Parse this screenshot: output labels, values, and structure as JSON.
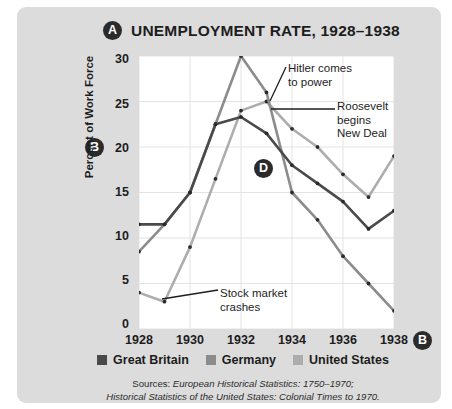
{
  "figure": {
    "marker_a": "A",
    "marker_b": "B",
    "marker_d": "D",
    "title": "UNEMPLOYMENT RATE, 1928–1938"
  },
  "axes": {
    "ylabel": "Percent of Work Force",
    "y_ticks": [
      "0",
      "5",
      "10",
      "15",
      "20",
      "25",
      "30"
    ],
    "x_ticks": [
      "1928",
      "1930",
      "1932",
      "1934",
      "1936",
      "1938"
    ]
  },
  "legend": {
    "items": [
      {
        "label": "Great Britain",
        "color": "#4a4a4a"
      },
      {
        "label": "Germany",
        "color": "#8c8c8c"
      },
      {
        "label": "United States",
        "color": "#adadad"
      }
    ]
  },
  "annotations": [
    {
      "id": "hitler",
      "text": "Hitler comes\nto power"
    },
    {
      "id": "roosevelt",
      "text": "Roosevelt\nbegins\nNew Deal"
    },
    {
      "id": "crash",
      "text": "Stock market\ncrashes"
    }
  ],
  "sources": {
    "line1_prefix": "Sources: ",
    "line1_italic": "European Historical Statistics: 1750–1970;",
    "line2_italic": "Historical Statistics of the United States: Colonial Times to 1970."
  },
  "chart_data": {
    "type": "line",
    "title": "UNEMPLOYMENT RATE, 1928–1938",
    "xlabel": "",
    "ylabel": "Percent of Work Force",
    "xlim": [
      1928,
      1938
    ],
    "ylim": [
      0,
      30
    ],
    "y_ticks": [
      0,
      5,
      10,
      15,
      20,
      25,
      30
    ],
    "x_ticks": [
      1928,
      1930,
      1932,
      1934,
      1936,
      1938
    ],
    "grid": true,
    "legend_position": "bottom",
    "x": [
      1928,
      1929,
      1930,
      1931,
      1932,
      1933,
      1934,
      1935,
      1936,
      1937,
      1938
    ],
    "series": [
      {
        "name": "Great Britain",
        "color": "#4a4a4a",
        "values": [
          11.5,
          11.5,
          15.0,
          22.5,
          23.3,
          21.5,
          18.0,
          16.0,
          14.0,
          11.0,
          13.0
        ]
      },
      {
        "name": "Germany",
        "color": "#8c8c8c",
        "values": [
          8.5,
          11.5,
          15.0,
          22.5,
          30.0,
          26.0,
          15.0,
          12.0,
          8.0,
          5.0,
          2.0
        ]
      },
      {
        "name": "United States",
        "color": "#adadad",
        "values": [
          4.0,
          3.0,
          9.0,
          16.5,
          24.0,
          25.0,
          22.0,
          20.0,
          17.0,
          14.5,
          19.0
        ]
      }
    ],
    "annotations": [
      {
        "text": "Hitler comes to power",
        "points_to_year": 1933,
        "points_to_value": 26.0
      },
      {
        "text": "Roosevelt begins New Deal",
        "points_to_year": 1933,
        "points_to_value": 25.0
      },
      {
        "text": "Stock market crashes",
        "points_to_year": 1929,
        "points_to_value": 3.0
      }
    ]
  }
}
